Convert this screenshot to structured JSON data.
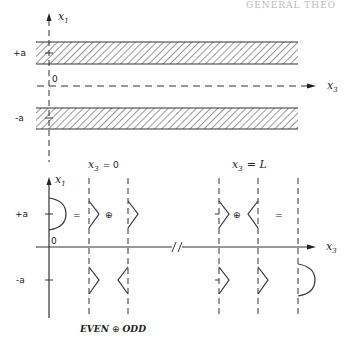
{
  "header": {
    "partial_text": "GENERAL THEO"
  },
  "top_diagram": {
    "axis_vertical": {
      "label": "x",
      "subscript": "1"
    },
    "axis_horizontal": {
      "label": "x",
      "subscript": "3"
    },
    "ticks": {
      "plus_a": "+a",
      "minus_a": "-a",
      "origin": "0"
    },
    "slabs": [
      "upper-hatched-slab",
      "lower-hatched-slab"
    ]
  },
  "bottom_diagram": {
    "axis_vertical": {
      "label": "x",
      "subscript": "1"
    },
    "axis_horizontal": {
      "label": "x",
      "subscript": "3"
    },
    "ticks": {
      "plus_a": "+a",
      "minus_a": "-a",
      "origin": "0"
    },
    "section_left": {
      "label": "x",
      "subscript": "3",
      "eq": "= 0"
    },
    "section_right": {
      "label": "x",
      "subscript": "3",
      "eq": "= L"
    },
    "operators": {
      "equals": "=",
      "oplus": "⊕"
    },
    "caption": {
      "even": "EVEN",
      "op": "⊕",
      "odd": "ODD"
    },
    "axis_break": "//"
  }
}
